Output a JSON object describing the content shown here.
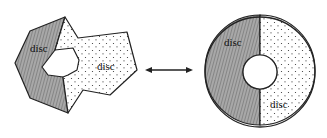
{
  "figure": {
    "left_shape": {
      "description": "irregular polygonal region with a hole, split into two parts",
      "regions": [
        {
          "label": "disc",
          "fill": "hatched"
        },
        {
          "label": "disc",
          "fill": "dotted"
        }
      ]
    },
    "relation": {
      "symbol": "double-headed-arrow"
    },
    "right_shape": {
      "description": "annulus split into two halves",
      "regions": [
        {
          "label": "disc",
          "fill": "hatched"
        },
        {
          "label": "disc",
          "fill": "dotted"
        }
      ]
    }
  },
  "colors": {
    "stroke": "#222222",
    "hatch_fill": "#9a9a9a",
    "background": "#ffffff"
  }
}
